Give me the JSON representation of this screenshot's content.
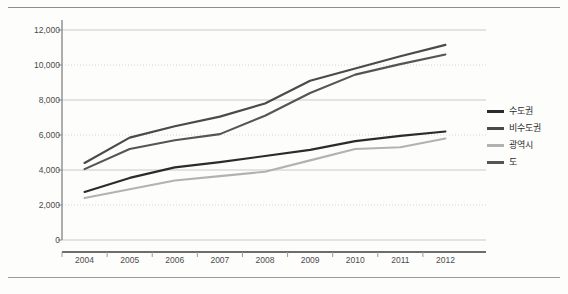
{
  "page": {
    "corner_note": "",
    "background": "#fdfdfc",
    "rule_color": "#8d8d8d"
  },
  "chart_data": {
    "type": "line",
    "title": "",
    "subtitle": "",
    "xlabel": "",
    "ylabel": "",
    "categories": [
      "2004",
      "2005",
      "2006",
      "2007",
      "2008",
      "2009",
      "2010",
      "2011",
      "2012"
    ],
    "ylim": [
      0,
      12000
    ],
    "ytick_values": [
      0,
      2000,
      4000,
      6000,
      8000,
      10000,
      12000
    ],
    "ytick_labels": [
      "0",
      "2,000",
      "4,000",
      "6,000",
      "8,000",
      "10,000",
      "12,000"
    ],
    "grid": true,
    "grid_axis": "y",
    "legend_position": "right",
    "series": [
      {
        "name": "수도권",
        "color": "#2b2b2b",
        "values": [
          2750,
          3550,
          4150,
          4450,
          4800,
          5150,
          5650,
          5950,
          6200
        ]
      },
      {
        "name": "비수도권",
        "color": "#4a4a4a",
        "values": [
          4400,
          5850,
          6500,
          7050,
          7800,
          9100,
          9800,
          10500,
          11150
        ]
      },
      {
        "name": "광역시",
        "color": "#b2b2b2",
        "values": [
          2400,
          2900,
          3400,
          3650,
          3900,
          4550,
          5200,
          5300,
          5800
        ]
      },
      {
        "name": "도",
        "color": "#555555",
        "values": [
          4050,
          5200,
          5700,
          6050,
          7100,
          8400,
          9450,
          10050,
          10600
        ]
      }
    ]
  }
}
